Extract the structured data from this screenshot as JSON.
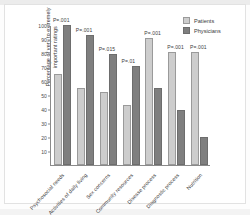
{
  "chart_data": {
    "type": "bar",
    "title": "",
    "xlabel": "",
    "ylabel": "Percentage of very to extremely important ratings",
    "ylim": [
      0,
      100
    ],
    "yticks": [
      100,
      90,
      80,
      70,
      60,
      50,
      40,
      30,
      20,
      10
    ],
    "grid": false,
    "legend_position": "top-right",
    "categories": [
      "Psychosocial needs",
      "Activities of daily living",
      "Sex concerns",
      "Community resources",
      "Disease process",
      "Diagnostic process",
      "Nutrition"
    ],
    "series": [
      {
        "name": "Patients",
        "color": "#cdcdcd",
        "values": [
          65,
          55,
          52,
          43,
          91,
          81,
          81
        ]
      },
      {
        "name": "Physicians",
        "color": "#7f7f7f",
        "values": [
          100,
          93,
          79,
          71,
          55,
          39,
          20
        ]
      }
    ],
    "annotations": [
      "P=.001",
      "P=.001",
      "P=.015",
      "P=.01",
      "P=.001",
      "P=.001",
      "P=.001"
    ]
  },
  "legend": {
    "patients_label": "Patients",
    "physicians_label": "Physicians"
  }
}
